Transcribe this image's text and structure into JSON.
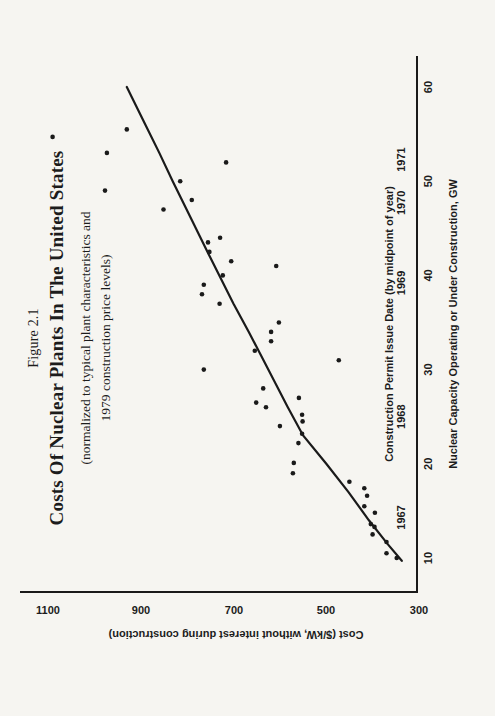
{
  "figure": {
    "figure_label": "Figure 2.1",
    "title": "Costs Of Nuclear Plants In The United States",
    "subtitle_line1": "(normalized to typical plant characteristics and",
    "subtitle_line2": "1979 construction price levels)"
  },
  "axes": {
    "y_title": "Cost ($/kW, without interest during construction)",
    "x_inner_title": "Construction Permit Issue Date (by midpoint of year)",
    "x_title": "Nuclear Capacity Operating or Under Construction, GW"
  },
  "chart_data": {
    "type": "scatter",
    "title": "Costs Of Nuclear Plants In The United States",
    "xlabel": "Nuclear Capacity Operating or Under Construction, GW",
    "ylabel": "Cost ($/kW, without interest during construction)",
    "xlim": [
      6,
      63
    ],
    "ylim": [
      300,
      1160
    ],
    "grid": false,
    "x_ticks": [
      10,
      20,
      30,
      40,
      50,
      60
    ],
    "y_ticks": [
      1100,
      900,
      700,
      500,
      300
    ],
    "year_markers": [
      {
        "label": "1967",
        "gw": 14.3
      },
      {
        "label": "1968",
        "gw": 25.0
      },
      {
        "label": "1969",
        "gw": 39.2
      },
      {
        "label": "1970",
        "gw": 47.7
      },
      {
        "label": "1971",
        "gw": 52.3
      }
    ],
    "points": [
      [
        54.7,
        1090
      ],
      [
        53,
        973
      ],
      [
        55.5,
        930
      ],
      [
        50,
        815
      ],
      [
        52,
        716
      ],
      [
        49,
        977
      ],
      [
        48,
        790
      ],
      [
        47,
        851
      ],
      [
        44,
        729
      ],
      [
        43.5,
        755
      ],
      [
        42.5,
        752
      ],
      [
        41.5,
        705
      ],
      [
        41,
        608
      ],
      [
        40,
        723
      ],
      [
        39,
        764
      ],
      [
        38,
        768
      ],
      [
        37,
        730
      ],
      [
        35,
        602
      ],
      [
        34,
        619
      ],
      [
        33,
        619
      ],
      [
        32,
        654
      ],
      [
        31,
        473
      ],
      [
        30,
        764
      ],
      [
        28,
        636
      ],
      [
        26.5,
        651
      ],
      [
        26,
        630
      ],
      [
        27,
        559
      ],
      [
        25.2,
        552
      ],
      [
        24.5,
        551
      ],
      [
        24,
        600
      ],
      [
        23.2,
        552
      ],
      [
        22.2,
        560
      ],
      [
        20.1,
        570
      ],
      [
        19,
        572
      ],
      [
        18.1,
        450
      ],
      [
        17.4,
        418
      ],
      [
        16.6,
        412
      ],
      [
        15.5,
        418
      ],
      [
        14.8,
        395
      ],
      [
        13.6,
        404
      ],
      [
        13.3,
        396
      ],
      [
        12.5,
        400
      ],
      [
        11.7,
        370
      ],
      [
        10.5,
        370
      ],
      [
        10,
        348
      ]
    ],
    "trend_line": [
      [
        9.7,
        337
      ],
      [
        11.5,
        368
      ],
      [
        14,
        408
      ],
      [
        17,
        452
      ],
      [
        20,
        500
      ],
      [
        23,
        550
      ],
      [
        26,
        583
      ],
      [
        30,
        625
      ],
      [
        34,
        667
      ],
      [
        37,
        700
      ],
      [
        42,
        751
      ],
      [
        46,
        791
      ],
      [
        50,
        831
      ],
      [
        53,
        860
      ],
      [
        56,
        890
      ],
      [
        60,
        930
      ]
    ],
    "ink_color": "#1a1a1a",
    "point_radius": 2.3,
    "line_width": 2.2
  }
}
